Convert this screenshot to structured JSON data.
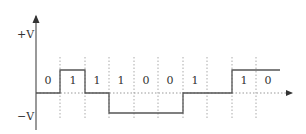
{
  "diagram": {
    "type": "line-coding-waveform",
    "y_axis": {
      "top_label": "+V",
      "bottom_label": "−V"
    },
    "bits": [
      "0",
      "1",
      "1",
      "1",
      "0",
      "0",
      "1",
      "",
      "1",
      "0"
    ],
    "colors": {
      "signal": "#555555",
      "axis": "#555555",
      "grid": "#aaaaaa",
      "text": "#333333"
    }
  }
}
